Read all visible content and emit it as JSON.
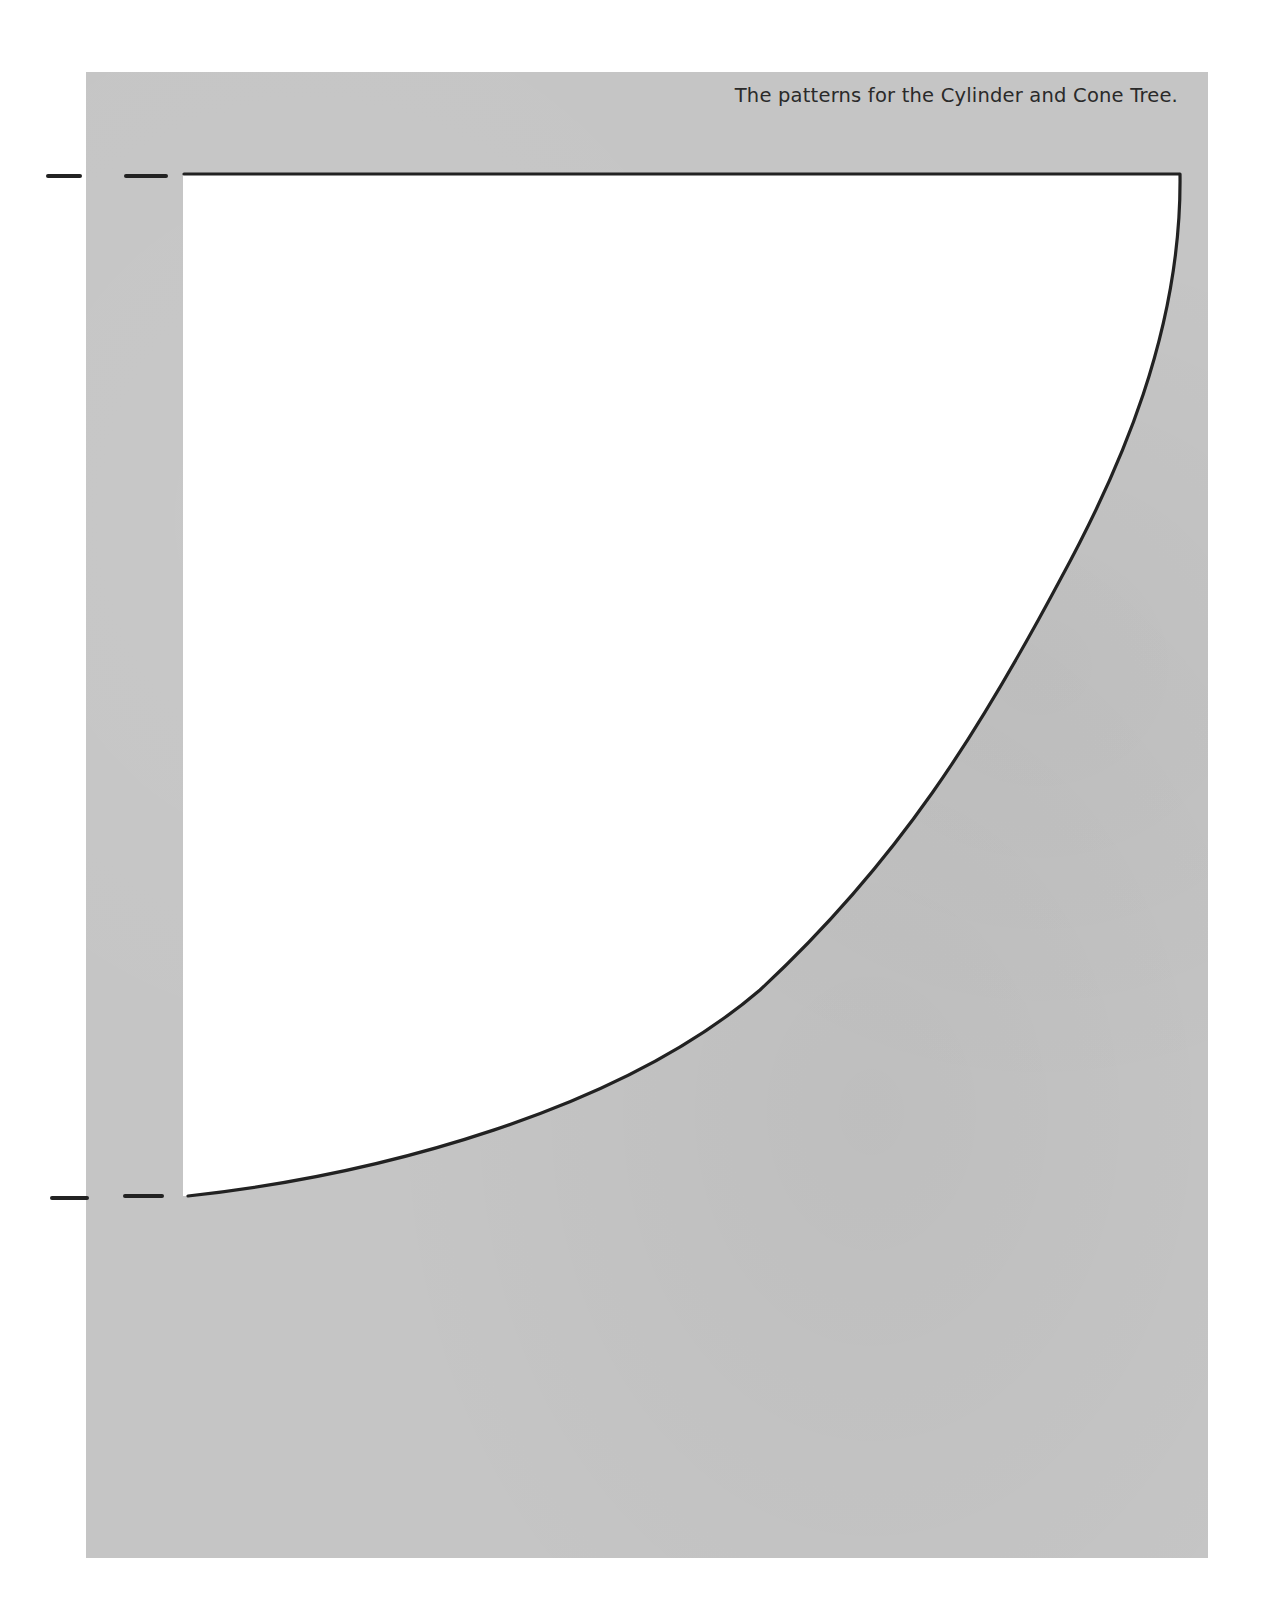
{
  "document": {
    "caption": "The patterns for the Cylinder and Cone Tree.",
    "colors": {
      "page_background": "#c5c5c5",
      "pattern_fill": "#ffffff",
      "outline": "#222222",
      "text": "#2a2a2a"
    }
  },
  "pattern": {
    "shape": "cone-tree-quarter-fan",
    "top_edge": {
      "x1": 183,
      "y1": 174,
      "x2": 1180,
      "y2": 174
    },
    "left_edge_x": 183,
    "curve_points": [
      [
        1180,
        174
      ],
      [
        1170,
        260
      ],
      [
        1161,
        310
      ],
      [
        1138,
        400
      ],
      [
        1098,
        500
      ],
      [
        1075,
        550
      ],
      [
        1010,
        673
      ],
      [
        953,
        783
      ],
      [
        903,
        848
      ],
      [
        833,
        930
      ],
      [
        727,
        1017
      ],
      [
        610,
        1077
      ],
      [
        500,
        1123
      ],
      [
        340,
        1168
      ],
      [
        188,
        1196
      ]
    ],
    "registration_marks": {
      "top": [
        {
          "x1": 47,
          "x2": 80,
          "y": 176
        },
        {
          "x1": 125,
          "x2": 166,
          "y": 176
        }
      ],
      "bottom": [
        {
          "x1": 51,
          "x2": 87,
          "y": 1198
        },
        {
          "x1": 124,
          "x2": 162,
          "y": 1196
        }
      ]
    }
  }
}
